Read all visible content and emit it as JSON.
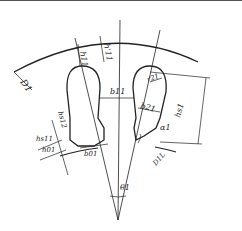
{
  "diagram": {
    "type": "rotor slot dimension drawing",
    "labels": {
      "outer_diameter": "D1",
      "inner_diameter": "D1L",
      "slot_height_top": "h11",
      "slot_height_top_prime": "h'11",
      "tooth_width": "b11",
      "slot_radius": "r21",
      "slot_width": "b21",
      "slot_height_right": "hs1",
      "slot_section_height_2": "hs12",
      "slot_section_height_1": "hs11",
      "slot_opening_height": "h01",
      "slot_opening_width": "b01",
      "angle_alpha": "α1",
      "angle_theta": "θ1"
    },
    "colors": {
      "line": "#222222",
      "background": "#ffffff"
    }
  }
}
